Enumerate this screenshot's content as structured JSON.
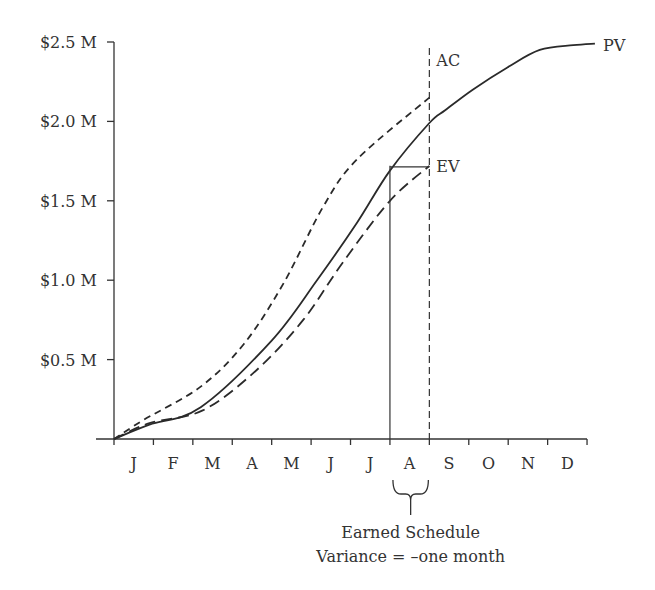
{
  "chart_data": {
    "type": "line",
    "title": "",
    "xlabel": "",
    "ylabel": "",
    "x_tick_labels": [
      "J",
      "F",
      "M",
      "A",
      "M",
      "J",
      "J",
      "A",
      "S",
      "O",
      "N",
      "D"
    ],
    "y_tick_labels": [
      "$0.5 M",
      "$1.0 M",
      "$1.5 M",
      "$2.0 M",
      "$2.5 M"
    ],
    "y_tick_values": [
      0.5,
      1.0,
      1.5,
      2.0,
      2.5
    ],
    "ylim": [
      0,
      2.5
    ],
    "xlim": [
      0,
      12
    ],
    "grid": false,
    "legend": "inline labels at line ends",
    "series": [
      {
        "name": "PV",
        "style": "solid",
        "points": [
          [
            0,
            0
          ],
          [
            0.9,
            0.09
          ],
          [
            2.2,
            0.2
          ],
          [
            4.0,
            0.62
          ],
          [
            5.15,
            1.0
          ],
          [
            6.16,
            1.36
          ],
          [
            7.0,
            1.69
          ],
          [
            8.0,
            1.99
          ],
          [
            8.4,
            2.07
          ],
          [
            9.1,
            2.2
          ],
          [
            9.98,
            2.34
          ],
          [
            10.8,
            2.45
          ],
          [
            11.65,
            2.48
          ],
          [
            12.2,
            2.49
          ]
        ]
      },
      {
        "name": "AC",
        "style": "short-dash",
        "points": [
          [
            0,
            0
          ],
          [
            0.75,
            0.12
          ],
          [
            2.2,
            0.33
          ],
          [
            3.3,
            0.6
          ],
          [
            4.3,
            0.98
          ],
          [
            5.3,
            1.46
          ],
          [
            6.16,
            1.76
          ],
          [
            8.0,
            2.15
          ]
        ]
      },
      {
        "name": "EV",
        "style": "long-dash",
        "points": [
          [
            0,
            0
          ],
          [
            0.9,
            0.1
          ],
          [
            2.25,
            0.18
          ],
          [
            3.6,
            0.43
          ],
          [
            4.8,
            0.75
          ],
          [
            5.8,
            1.11
          ],
          [
            7.0,
            1.5
          ],
          [
            8.0,
            1.72
          ]
        ]
      }
    ],
    "annotations": {
      "status_date_month": 8.0,
      "earned_schedule_month": 7.0,
      "ev_level": 1.72,
      "brace_label_line1": "Earned Schedule",
      "brace_label_line2": "Variance = –one month"
    }
  }
}
